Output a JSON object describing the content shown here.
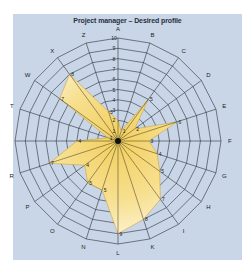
{
  "chart_data": {
    "type": "radar",
    "title": "Project manager – Desired profile",
    "axes": [
      "A",
      "B",
      "C",
      "D",
      "E",
      "F",
      "G",
      "H",
      "I",
      "K",
      "L",
      "N",
      "O",
      "P",
      "R",
      "S",
      "T",
      "W",
      "X",
      "Z"
    ],
    "axis_labels_visible": [
      "A",
      "B",
      "C",
      "D",
      "E",
      "F",
      "G",
      "H",
      "I",
      "K",
      "L",
      "N",
      "O",
      "P",
      "R",
      "",
      "T",
      "W",
      "X",
      "Z"
    ],
    "values": [
      2,
      1,
      5,
      2,
      6,
      3,
      4,
      5,
      7,
      8,
      9,
      5,
      5,
      4,
      7,
      4,
      1,
      7,
      8,
      3
    ],
    "range": [
      0,
      10
    ],
    "rings": [
      1,
      2,
      3,
      4,
      5,
      6,
      7,
      8,
      9,
      10
    ],
    "tick_labels_shown_on_axis": "A",
    "grid": true,
    "fill_color": "#f5d878",
    "fill_highlight": "#fffbe8",
    "grid_color": "#2b2f38",
    "background_color": "#c9d6e8"
  }
}
